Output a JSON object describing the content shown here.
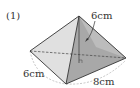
{
  "problem": {
    "number_label": "(1)"
  },
  "figure": {
    "type": "square-based pyramid (quadrangular pyramid)",
    "labels": {
      "height": "6cm",
      "base_side_left": "6cm",
      "base_side_right": "8cm"
    },
    "colors": {
      "left_face": "#e2e2e2",
      "front_face": "#a9a9a9",
      "right_face": "#bdbdbd",
      "edge": "#333333",
      "dashed_arc": "#b0b0b0"
    }
  }
}
